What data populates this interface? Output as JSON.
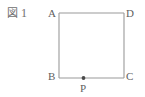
{
  "figure": {
    "caption_kanji": "図",
    "caption_number": "1",
    "caption_full": "図 1"
  },
  "diagram": {
    "type": "geometry-square",
    "shape_name": "square-ABCD",
    "stroke_color": "#9a9a9a",
    "label_color": "#5f5f5f",
    "background_color": "#ffffff",
    "vertices": [
      {
        "id": "A",
        "label": "A",
        "position": "top-left",
        "x": 59,
        "y": 13
      },
      {
        "id": "D",
        "label": "D",
        "position": "top-right",
        "x": 124,
        "y": 13
      },
      {
        "id": "B",
        "label": "B",
        "position": "bottom-left",
        "x": 59,
        "y": 78
      },
      {
        "id": "C",
        "label": "C",
        "position": "bottom-right",
        "x": 124,
        "y": 78
      }
    ],
    "points": [
      {
        "id": "P",
        "label": "P",
        "on_segment": "BC",
        "x": 83.5,
        "y": 78,
        "marker": "filled-dot"
      }
    ],
    "edges": [
      {
        "from": "A",
        "to": "D"
      },
      {
        "from": "D",
        "to": "C"
      },
      {
        "from": "C",
        "to": "B"
      },
      {
        "from": "B",
        "to": "A"
      }
    ]
  }
}
